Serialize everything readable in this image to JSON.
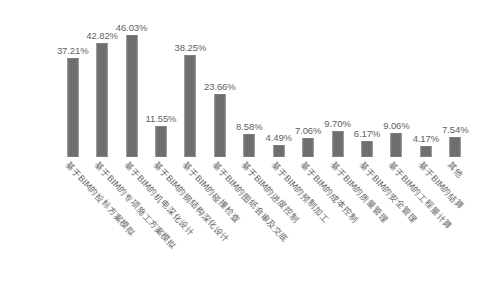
{
  "chart_data": {
    "type": "bar",
    "title": "",
    "subtitle": "",
    "xlabel": "",
    "ylabel": "",
    "ylim": [
      0,
      50
    ],
    "grid": false,
    "legend": "none",
    "bar_color": "#6e6e6e",
    "background_color": "#ffffff",
    "value_suffix": "%",
    "categories": [
      "基于BIM的投标方案模拟",
      "基于BIM的专项施工方案模拟",
      "基于BIM的机电深化设计",
      "基于BIM的钢结构深化设计",
      "基于BIM的碰撞检查",
      "基于BIM的图纸会审及交底",
      "基于BIM的进度控制",
      "基于BIM的预制加工",
      "基于BIM的成本控制",
      "基于BIM的质量管理",
      "基于BIM的安全管理",
      "基于BIM的工程量计算",
      "基于BIM的结算",
      "其他"
    ],
    "values": [
      37.21,
      42.82,
      46.03,
      11.55,
      38.25,
      23.66,
      8.58,
      4.49,
      7.06,
      9.7,
      6.17,
      9.06,
      4.17,
      7.54
    ],
    "value_labels": [
      "37.21%",
      "42.82%",
      "46.03%",
      "11.55%",
      "38.25%",
      "23.66%",
      "8.58%",
      "4.49%",
      "7.06%",
      "9.70%",
      "6.17%",
      "9.06%",
      "4.17%",
      "7.54%"
    ]
  }
}
